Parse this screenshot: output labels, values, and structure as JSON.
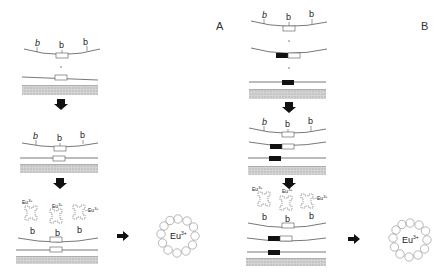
{
  "panels": [
    {
      "id": "A",
      "label": "A",
      "ligand_label": "b",
      "ion_label": "Eu",
      "ion_charge": "3+",
      "complex_label": "Eu",
      "complex_charge": "3+"
    },
    {
      "id": "B",
      "label": "B",
      "ligand_label": "b",
      "ion_label": "Eu",
      "ion_charge": "3+",
      "complex_label": "Eu",
      "complex_charge": "3+"
    }
  ],
  "colors": {
    "line": "#555555",
    "substrate": "#c8c8c8",
    "block_filled": "#111111",
    "arrow": "#111111"
  }
}
